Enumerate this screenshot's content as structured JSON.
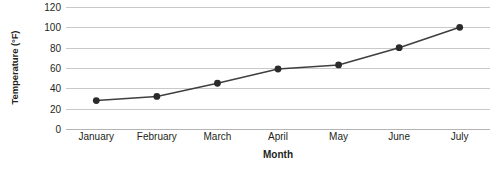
{
  "chart_data": {
    "type": "line",
    "title": "",
    "xlabel": "Month",
    "ylabel": "Temperature (°F)",
    "categories": [
      "January",
      "February",
      "March",
      "April",
      "May",
      "June",
      "July"
    ],
    "values": [
      28,
      32,
      45,
      59,
      63,
      80,
      100
    ],
    "series": [
      {
        "name": "Temperature",
        "values": [
          28,
          32,
          45,
          59,
          63,
          80,
          100
        ]
      }
    ],
    "ylim": [
      0,
      120
    ],
    "yticks": [
      0,
      20,
      40,
      60,
      80,
      100,
      120
    ],
    "ytick_labels": [
      "0",
      "20",
      "40",
      "60",
      "80",
      "100",
      "120"
    ],
    "grid": true,
    "grid_axis": "y",
    "legend": "none",
    "marker": "circle",
    "line_color": "#3f3f3f",
    "marker_color": "#2b2b2b",
    "grid_color": "#c9c9c9",
    "background_color": "#ffffff",
    "text_color": "#231f20"
  }
}
